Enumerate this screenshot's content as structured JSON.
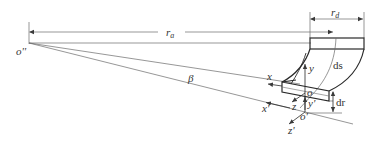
{
  "diagram": {
    "colors": {
      "stroke": "#3a3a3a",
      "thin": "#6a6a6a",
      "text": "#333333",
      "background": "#ffffff"
    },
    "labels": {
      "origin_far": "o''",
      "r_a": "r",
      "r_a_sub": "a",
      "r_d": "r",
      "r_d_sub": "d",
      "beta": "β",
      "x": "x",
      "x_prime": "x'",
      "y": "y",
      "y_prime": "y'",
      "z": "z",
      "z_prime": "z'",
      "o": "o",
      "o_prime": "o'",
      "ds": "ds",
      "dr": "dr"
    }
  }
}
